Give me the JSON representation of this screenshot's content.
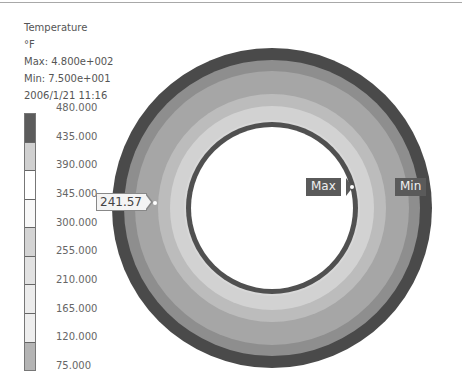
{
  "info": {
    "quantity": "Temperature",
    "unit": "°F",
    "max": "Max: 4.800e+002",
    "min": "Min: 7.500e+001",
    "timestamp": "2006/1/21 11:16"
  },
  "legend": {
    "labels": [
      "480.000",
      "435.000",
      "390.000",
      "345.000",
      "300.000",
      "255.000",
      "210.000",
      "165.000",
      "120.000",
      "75.000"
    ],
    "segment_colors": [
      "#5c5c5c",
      "#d0d0d0",
      "#ffffff",
      "#f8f8f8",
      "#d4d4d4",
      "#e2e2e2",
      "#ececec",
      "#eeeeee",
      "#b4b4b4",
      "#444444"
    ]
  },
  "ring": {
    "center_x": 272,
    "center_y": 208,
    "outer_radius": 160,
    "inner_radius": 81,
    "bands": [
      {
        "r": 160,
        "color": "#4a4a4a"
      },
      {
        "r": 148,
        "color": "#8e8e8e"
      },
      {
        "r": 137,
        "color": "#a6a6a6"
      },
      {
        "r": 114,
        "color": "#bcbcbc"
      },
      {
        "r": 102,
        "color": "#d2d2d2"
      },
      {
        "r": 88,
        "color": "#d8d8d8"
      },
      {
        "r": 86,
        "color": "#505050"
      }
    ],
    "hole_color": "#ffffff"
  },
  "probes": {
    "value_label": "241.57",
    "max_label": "Max",
    "min_label": "Min"
  }
}
